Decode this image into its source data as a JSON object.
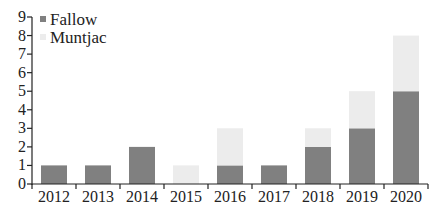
{
  "chart_data": {
    "type": "bar",
    "stacked": true,
    "title": "",
    "xlabel": "",
    "ylabel": "",
    "categories": [
      "2012",
      "2013",
      "2014",
      "2015",
      "2016",
      "2017",
      "2018",
      "2019",
      "2020"
    ],
    "series": [
      {
        "name": "Fallow",
        "color": "#808080",
        "values": [
          1,
          1,
          2,
          0,
          1,
          1,
          2,
          3,
          5
        ]
      },
      {
        "name": "Muntjac",
        "color": "#ececec",
        "values": [
          0,
          0,
          0,
          1,
          2,
          0,
          1,
          2,
          3
        ]
      }
    ],
    "ylim": [
      0,
      9
    ],
    "yticks": [
      0,
      1,
      2,
      3,
      4,
      5,
      6,
      7,
      8,
      9
    ],
    "grid": false,
    "legend_position": "top-left"
  }
}
